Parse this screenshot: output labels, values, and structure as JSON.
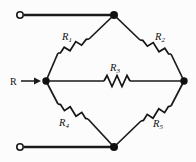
{
  "figure": {
    "name": "resistor-bridge-network",
    "background_color": "#fcfcfc",
    "line_color": "#1a1a1a",
    "width": 196,
    "height": 162
  },
  "source": {
    "label": "R",
    "arrow": "right-arrow"
  },
  "resistors": [
    {
      "id": "R1",
      "letter": "R",
      "subscript": "1",
      "position": "upper-left-branch"
    },
    {
      "id": "R2",
      "letter": "R",
      "subscript": "2",
      "position": "upper-right-branch"
    },
    {
      "id": "R3",
      "letter": "R",
      "subscript": "3",
      "position": "middle-horizontal-branch"
    },
    {
      "id": "R4",
      "letter": "R",
      "subscript": "4",
      "position": "lower-left-branch"
    },
    {
      "id": "R5",
      "letter": "R",
      "subscript": "5",
      "position": "lower-right-branch"
    }
  ],
  "nodes": [
    {
      "id": "top",
      "type": "junction-dot",
      "x": 114,
      "y": 15
    },
    {
      "id": "left",
      "type": "junction-dot",
      "x": 46,
      "y": 81
    },
    {
      "id": "right",
      "type": "junction-dot",
      "x": 184,
      "y": 81
    },
    {
      "id": "bottom",
      "type": "junction-dot",
      "x": 114,
      "y": 147
    }
  ],
  "terminals": [
    {
      "id": "top-left-terminal",
      "type": "open-circle",
      "x": 20,
      "y": 15
    },
    {
      "id": "bottom-left-terminal",
      "type": "open-circle",
      "x": 20,
      "y": 147
    }
  ]
}
